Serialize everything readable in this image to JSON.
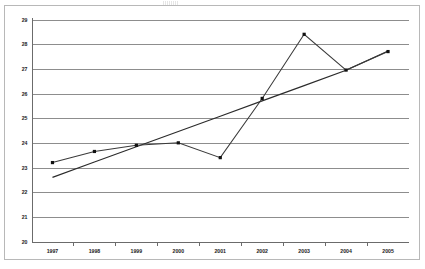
{
  "chart_data": {
    "type": "line",
    "title": "",
    "xlabel": "",
    "ylabel": "",
    "categories": [
      "1997",
      "1998",
      "1999",
      "2000",
      "2001",
      "2002",
      "2003",
      "2004",
      "2005"
    ],
    "yticks": [
      "20",
      "21",
      "22",
      "23",
      "24",
      "25",
      "26",
      "27",
      "28",
      "29"
    ],
    "ylim": [
      20,
      29
    ],
    "grid": true,
    "legend": "none",
    "series": [
      {
        "name": "data",
        "style": "line-with-square-markers",
        "color": "#3a3a3a",
        "values": [
          23.2,
          23.65,
          23.9,
          24.0,
          23.4,
          25.8,
          28.4,
          26.95,
          27.7
        ]
      },
      {
        "name": "linear-trendline",
        "style": "straight-line",
        "color": "#2b2b2b",
        "values": [
          22.6,
          23.22,
          23.84,
          24.46,
          25.08,
          25.7,
          26.32,
          26.94,
          27.72
        ]
      }
    ]
  },
  "figure": {
    "frame_color": "#b8b8b8",
    "grid_color": "#8d8d8d",
    "axis_color": "#6b6b6b",
    "background": "#ffffff"
  }
}
